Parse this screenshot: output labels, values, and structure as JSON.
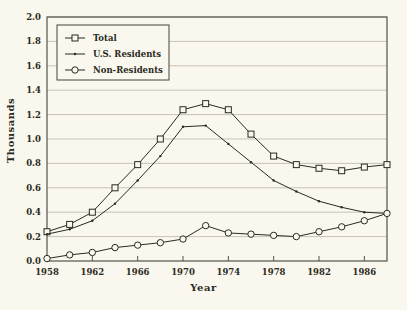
{
  "chart_data": {
    "type": "line",
    "title": "",
    "xlabel": "Year",
    "ylabel": "Thousands",
    "xlim": [
      1958,
      1988
    ],
    "ylim": [
      0.0,
      2.0
    ],
    "grid": true,
    "legend_position": "top-left",
    "x": [
      1958,
      1960,
      1962,
      1964,
      1966,
      1968,
      1970,
      1972,
      1974,
      1976,
      1978,
      1980,
      1982,
      1984,
      1986,
      1988
    ],
    "xticks": [
      1958,
      1962,
      1966,
      1970,
      1974,
      1978,
      1982,
      1986
    ],
    "xtick_labels": [
      "1958",
      "1962",
      "1966",
      "1970",
      "1974",
      "1978",
      "1982",
      "1986"
    ],
    "yticks": [
      0.0,
      0.2,
      0.4,
      0.6,
      0.8,
      1.0,
      1.2,
      1.4,
      1.6,
      1.8,
      2.0
    ],
    "ytick_labels": [
      "0.0",
      "0.2",
      "0.4",
      "0.6",
      "0.8",
      "1.0",
      "1.2",
      "1.4",
      "1.6",
      "1.8",
      "2.0"
    ],
    "series": [
      {
        "name": "Total",
        "marker": "square",
        "values": [
          0.24,
          0.3,
          0.4,
          0.6,
          0.79,
          1.0,
          1.24,
          1.29,
          1.24,
          1.04,
          0.86,
          0.79,
          0.76,
          0.74,
          0.77,
          0.79
        ]
      },
      {
        "name": "U.S. Residents",
        "marker": "dot",
        "values": [
          0.22,
          0.26,
          0.33,
          0.47,
          0.66,
          0.86,
          1.1,
          1.11,
          0.96,
          0.81,
          0.66,
          0.57,
          0.49,
          0.44,
          0.4,
          0.39
        ]
      },
      {
        "name": "Non-Residents",
        "marker": "circle",
        "values": [
          0.02,
          0.05,
          0.07,
          0.11,
          0.13,
          0.15,
          0.18,
          0.29,
          0.23,
          0.22,
          0.21,
          0.2,
          0.24,
          0.28,
          0.33,
          0.39
        ]
      }
    ]
  },
  "axes": {
    "y_title": "Thousands",
    "x_title": "Year"
  },
  "legend": {
    "entries": [
      {
        "label": "Total",
        "marker": "square"
      },
      {
        "label": "U.S. Residents",
        "marker": "dot"
      },
      {
        "label": "Non-Residents",
        "marker": "circle"
      }
    ]
  },
  "colors": {
    "background": "#faf8ee",
    "ink": "#2a2a22",
    "grid": "#b9b6a6",
    "frame": "#55544a"
  }
}
